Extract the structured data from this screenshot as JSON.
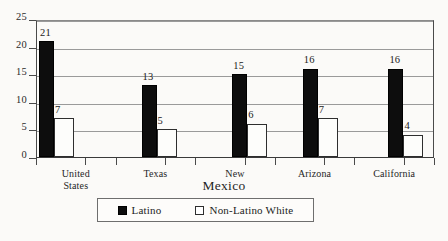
{
  "chart_data": {
    "type": "bar",
    "title": "",
    "subtitle": "",
    "xlabel": "Mexico",
    "ylabel": "",
    "ylim": [
      0,
      25
    ],
    "ytick_step": 5,
    "yticks": [
      "0",
      "5",
      "10",
      "15",
      "20",
      "25"
    ],
    "grid": true,
    "legend_position": "bottom",
    "categories": [
      "United States",
      "Texas",
      "New Mexico",
      "Arizona",
      "California"
    ],
    "category_lines": [
      {
        "line1": "United",
        "line2": "States"
      },
      {
        "line1": "Texas",
        "line2": ""
      },
      {
        "line1": "New",
        "line2": "Mexico"
      },
      {
        "line1": "Arizona",
        "line2": ""
      },
      {
        "line1": "California",
        "line2": ""
      }
    ],
    "series": [
      {
        "name": "Latino",
        "color": "#0d0d0d",
        "swatch": "filled-square",
        "values": [
          21,
          13,
          15,
          16,
          16
        ]
      },
      {
        "name": "Non-Latino White",
        "color": "#ffffff",
        "swatch": "hollow-square",
        "values": [
          7,
          5,
          6,
          7,
          4
        ]
      }
    ]
  },
  "legend": {
    "entries": [
      {
        "label": "Latino",
        "swatch": "filled-square"
      },
      {
        "label": "Non-Latino White",
        "swatch": "hollow-square"
      }
    ]
  },
  "colors": {
    "background": "#fbfaf8",
    "axis": "#4a4a4a",
    "gridline": "#9a9a9a",
    "latino_bar": "#0d0d0d",
    "nonlatino_bar": "#fdfdfb",
    "text": "#1a1a1a"
  }
}
